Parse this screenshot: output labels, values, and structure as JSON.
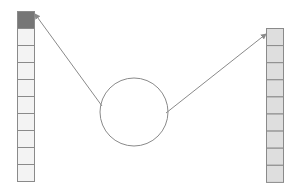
{
  "diagram": {
    "left_column": {
      "x": 17,
      "y": 11,
      "cell_width": 17,
      "cell_height": 17,
      "count": 10,
      "highlight_index": 0,
      "highlight_color": "#767676",
      "fill_color": "#f3f3f3",
      "stroke_color": "#8a8a8a"
    },
    "right_column": {
      "x": 266,
      "y": 28,
      "cell_width": 17,
      "cell_height": 17.1,
      "count": 9,
      "fill_color": "#dedede",
      "stroke_color": "#8a8a8a"
    },
    "circle": {
      "cx": 134,
      "cy": 112,
      "r": 34,
      "stroke_color": "#8a8a8a",
      "fill_color": "#ffffff"
    },
    "arrows": [
      {
        "from": [
          102,
          106
        ],
        "to": [
          35,
          14
        ],
        "color": "#8a8a8a"
      },
      {
        "from": [
          166,
          113
        ],
        "to": [
          266,
          34
        ],
        "color": "#8a8a8a"
      }
    ]
  }
}
